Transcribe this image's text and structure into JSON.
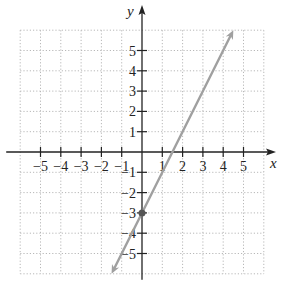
{
  "chart_data": {
    "type": "line",
    "title": "",
    "xlabel": "x",
    "ylabel": "y",
    "xlim": [
      -6,
      6
    ],
    "ylim": [
      -6,
      6
    ],
    "grid": true,
    "grid_style": "dotted",
    "x_ticks": [
      -5,
      -4,
      -3,
      -2,
      -1,
      1,
      2,
      3,
      4,
      5
    ],
    "y_ticks": [
      5,
      4,
      3,
      2,
      1,
      -1,
      -2,
      -3,
      -4,
      -5
    ],
    "x_tick_labels": [
      "−5",
      "−4",
      "−3",
      "−2",
      "−1",
      "1",
      "2",
      "3",
      "4",
      "5"
    ],
    "y_tick_labels": [
      "5",
      "4",
      "3",
      "2",
      "1",
      "−1",
      "−2",
      "−3",
      "−4",
      "−5"
    ],
    "series": [
      {
        "name": "y = 2x - 3",
        "slope": 2,
        "intercept": -3,
        "x": [
          -1.5,
          4.5
        ],
        "y": [
          -6,
          6
        ],
        "color": "#a0a0a0",
        "arrows": "both",
        "marked_point": [
          0,
          -3
        ]
      }
    ]
  },
  "colors": {
    "axis": "#222222",
    "grid": "#b8b8b8",
    "line": "#a0a0a0",
    "point": "#555555"
  }
}
